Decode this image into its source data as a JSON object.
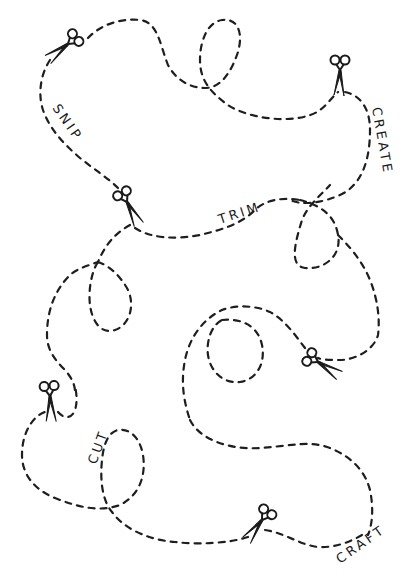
{
  "illustration": {
    "background": "#ffffff",
    "ink": "#1e1e1e",
    "words": {
      "snip": "SNIP",
      "create": "CREATE",
      "trim": "TRIM",
      "cut": "CUT",
      "craft": "CRAFT"
    },
    "scissors_count": 6
  }
}
